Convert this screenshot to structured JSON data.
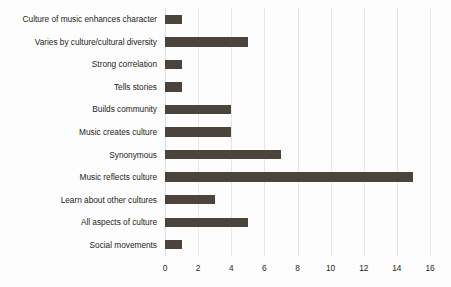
{
  "chart_data": {
    "type": "bar",
    "orientation": "horizontal",
    "title": "",
    "xlabel": "",
    "ylabel": "",
    "xlim": [
      0,
      16
    ],
    "xticks": [
      0,
      2,
      4,
      6,
      8,
      10,
      12,
      14,
      16
    ],
    "grid": true,
    "legend": false,
    "bar_color": "#4a443d",
    "background_color": "#fdfdfd",
    "gridline_color": "#e8e8e8",
    "categories": [
      "Culture of music enhances character",
      "Varies by culture/cultural diversity",
      "Strong correlation",
      "Tells stories",
      "Builds community",
      "Music creates culture",
      "Synonymous",
      "Music reflects culture",
      "Learn about other cultures",
      "All aspects of culture",
      "Social movements"
    ],
    "values": [
      1,
      5,
      1,
      1,
      4,
      4,
      7,
      15,
      3,
      5,
      1
    ]
  }
}
